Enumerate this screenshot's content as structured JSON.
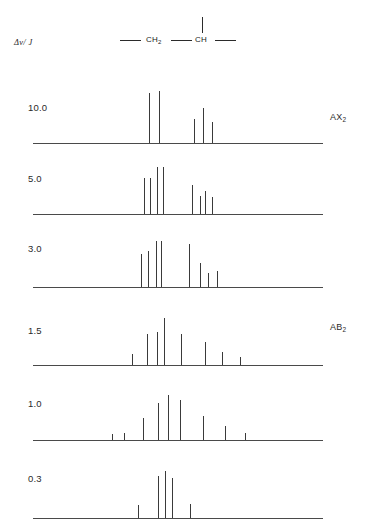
{
  "figure": {
    "axis_label": "Δν/ J",
    "structure": {
      "group_1": "CH",
      "group_1_sub": "2",
      "group_2": "CH",
      "name": "ch2-ch-fragment"
    },
    "limit_labels": [
      {
        "text": "AX",
        "sub": "2",
        "name": "limit-label-ax2",
        "top": 112,
        "left": 330
      },
      {
        "text": "AB",
        "sub": "2",
        "name": "limit-label-ab2",
        "top": 322,
        "left": 330
      }
    ]
  },
  "chart_data": {
    "type": "bar",
    "xlabel": "",
    "ylabel": "",
    "grid": false,
    "legend": "none",
    "x_axis_range_px": [
      33,
      323
    ],
    "annotations": [
      "AX2",
      "AB2"
    ],
    "series": [
      {
        "name": "10.0",
        "label": "10.0",
        "label_top": 102,
        "baseline_y": 143,
        "x": [
          149,
          159,
          194,
          203,
          212
        ],
        "heights": [
          50,
          52,
          24,
          35,
          21
        ]
      },
      {
        "name": "5.0",
        "label": "5.0",
        "label_top": 173,
        "baseline_y": 214,
        "x": [
          144,
          150,
          157,
          163,
          192,
          200,
          205,
          212
        ],
        "heights": [
          36,
          36,
          47,
          47,
          29,
          18,
          23,
          17
        ]
      },
      {
        "name": "3.0",
        "label": "3.0",
        "label_top": 243,
        "baseline_y": 287,
        "x": [
          141,
          148,
          156,
          161,
          189,
          200,
          208,
          217
        ],
        "heights": [
          33,
          36,
          46,
          46,
          43,
          24,
          14,
          16
        ]
      },
      {
        "name": "1.5",
        "label": "1.5",
        "label_top": 325,
        "baseline_y": 365,
        "x": [
          132,
          147,
          157,
          164,
          181,
          205,
          222,
          240
        ],
        "heights": [
          11,
          31,
          33,
          47,
          31,
          23,
          13,
          8
        ]
      },
      {
        "name": "1.0",
        "label": "1.0",
        "label_top": 398,
        "baseline_y": 440,
        "x": [
          112,
          124,
          143,
          158,
          168,
          180,
          203,
          225,
          245
        ],
        "heights": [
          6,
          7,
          22,
          37,
          45,
          40,
          24,
          14,
          7
        ]
      },
      {
        "name": "0.3",
        "label": "0.3",
        "label_top": 473,
        "baseline_y": 518,
        "x": [
          138,
          158,
          165,
          172,
          190
        ],
        "heights": [
          13,
          42,
          47,
          40,
          14
        ]
      }
    ]
  }
}
